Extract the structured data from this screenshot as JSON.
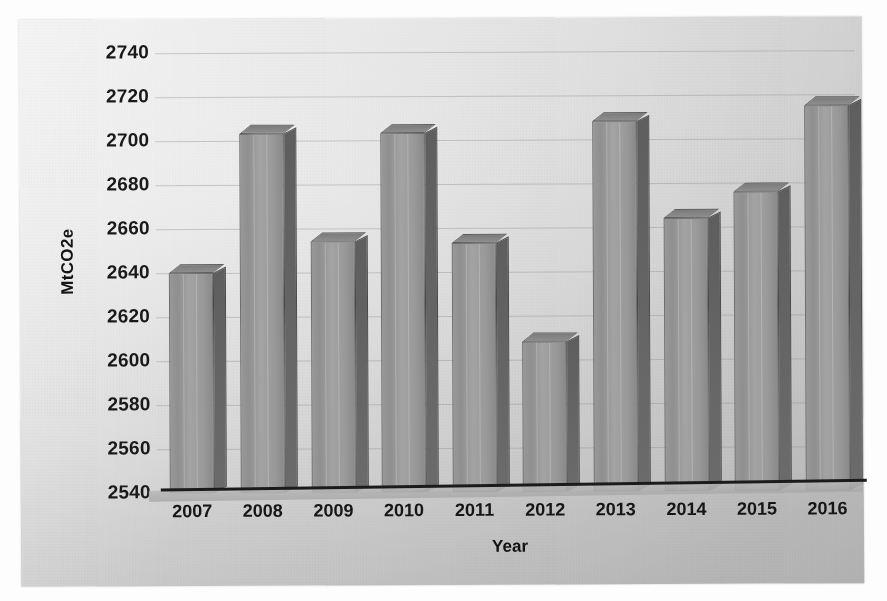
{
  "chart_data": {
    "type": "bar",
    "title": "",
    "xlabel": "Year",
    "ylabel": "MtCO2e",
    "categories": [
      "2007",
      "2008",
      "2009",
      "2010",
      "2011",
      "2012",
      "2013",
      "2014",
      "2015",
      "2016"
    ],
    "values": [
      2640,
      2703,
      2654,
      2703,
      2653,
      2608,
      2708,
      2664,
      2676,
      2715
    ],
    "ylim": [
      2540,
      2740
    ],
    "ytick_step": 20,
    "yticks": [
      "2740",
      "2720",
      "2700",
      "2680",
      "2660",
      "2640",
      "2620",
      "2600",
      "2580",
      "2560",
      "2540"
    ],
    "grid": true,
    "legend": "none",
    "style": "3d-column",
    "bar_color": "#9a9a9a",
    "bar_side_color": "#636363",
    "bar_border_color": "#6d6d6d",
    "axis_color": "#1b1b1b",
    "gridline_color": "#8c8c8c",
    "background_color": "#dcdcdc",
    "series": [
      {
        "name": "Emissions",
        "unit": "MtCO2e",
        "values": [
          2640,
          2703,
          2654,
          2703,
          2653,
          2608,
          2708,
          2664,
          2676,
          2715
        ]
      }
    ]
  }
}
